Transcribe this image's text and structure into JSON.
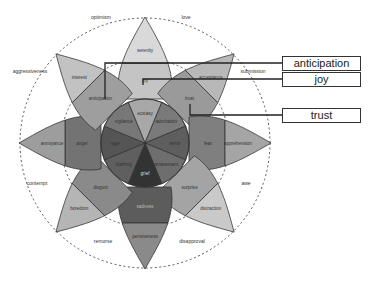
{
  "diagram": {
    "center": [
      145,
      143
    ],
    "petals": [
      {
        "angle": -90,
        "outer": "serenity",
        "middle": "joy",
        "inner": "ecstasy",
        "colors": [
          "#d9d9d9",
          "#c4c4c4",
          "#a8a8a8"
        ]
      },
      {
        "angle": -45,
        "outer": "acceptance",
        "middle": "trust",
        "inner": "admiration",
        "colors": [
          "#b8b8b8",
          "#9a9a9a",
          "#7a7a7a"
        ]
      },
      {
        "angle": 0,
        "outer": "apprehension",
        "middle": "fear",
        "inner": "terror",
        "colors": [
          "#a5a5a5",
          "#7f7f7f",
          "#5e5e5e"
        ]
      },
      {
        "angle": 45,
        "outer": "distraction",
        "middle": "surprise",
        "inner": "amazement",
        "colors": [
          "#c9c9c9",
          "#a4a4a4",
          "#6e6e6e"
        ]
      },
      {
        "angle": 90,
        "outer": "pensiveness",
        "middle": "sadness",
        "inner": "grief",
        "colors": [
          "#8a8a8a",
          "#5c5c5c",
          "#333333"
        ]
      },
      {
        "angle": 135,
        "outer": "boredom",
        "middle": "disgust",
        "inner": "loathing",
        "colors": [
          "#b5b5b5",
          "#8a8a8a",
          "#5f5f5f"
        ]
      },
      {
        "angle": 180,
        "outer": "annoyance",
        "middle": "anger",
        "inner": "rage",
        "colors": [
          "#9d9d9d",
          "#737373",
          "#555555"
        ]
      },
      {
        "angle": -135,
        "outer": "interest",
        "middle": "anticipation",
        "inner": "vigilance",
        "colors": [
          "#c2c2c2",
          "#9e9e9e",
          "#787878"
        ]
      }
    ],
    "dyads": [
      {
        "label": "love",
        "x": 186,
        "y": 19
      },
      {
        "label": "optimism",
        "x": 101,
        "y": 19
      },
      {
        "label": "aggressiveness",
        "x": 30,
        "y": 73
      },
      {
        "label": "submission",
        "x": 253,
        "y": 73
      },
      {
        "label": "contempt",
        "x": 37,
        "y": 185
      },
      {
        "label": "awe",
        "x": 246,
        "y": 185
      },
      {
        "label": "remorse",
        "x": 103,
        "y": 243
      },
      {
        "label": "disapproval",
        "x": 192,
        "y": 243
      }
    ],
    "callouts": [
      {
        "label": "anticipation",
        "top": 56,
        "line_y": 63,
        "anchor": [
          105,
          99
        ]
      },
      {
        "label": "joy",
        "top": 72,
        "line_y": 79,
        "anchor": [
          143,
          85
        ]
      },
      {
        "label": "trust",
        "top": 108,
        "line_y": 115,
        "anchor": [
          190,
          104
        ]
      }
    ]
  }
}
